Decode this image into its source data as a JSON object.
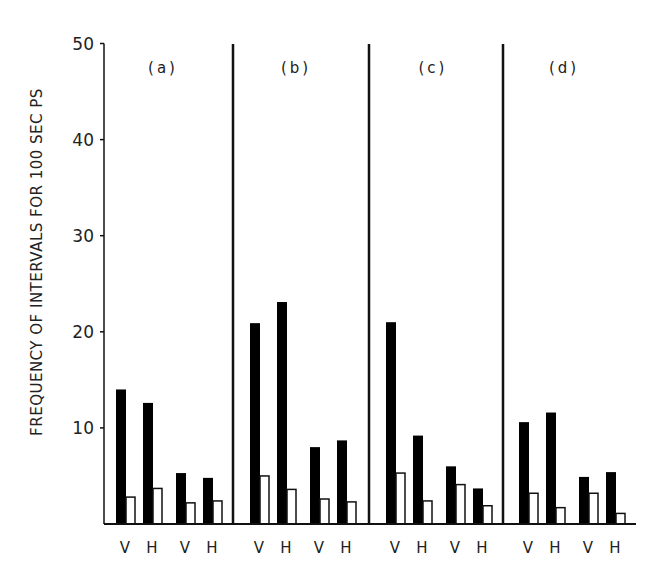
{
  "chart_data": {
    "type": "bar",
    "title": "",
    "xlabel": "",
    "ylabel": "FREQUENCY OF INTERVALS FOR 100 SEC PS",
    "ylim": [
      0,
      50
    ],
    "yticks": [
      10,
      20,
      30,
      40,
      50
    ],
    "ytick_labels": [
      "10",
      "20",
      "30",
      "40",
      "50"
    ],
    "grid": false,
    "legend": null,
    "panels": [
      {
        "label": "(a)",
        "categories": [
          "V",
          "H",
          "V",
          "H"
        ],
        "series": [
          {
            "name": "filled",
            "color": "#000000",
            "values": [
              14.0,
              12.6,
              5.3,
              4.8
            ]
          },
          {
            "name": "open",
            "color": "#ffffff",
            "values": [
              2.8,
              3.7,
              2.2,
              2.4
            ]
          }
        ]
      },
      {
        "label": "(b)",
        "categories": [
          "V",
          "H",
          "V",
          "H"
        ],
        "series": [
          {
            "name": "filled",
            "color": "#000000",
            "values": [
              20.9,
              23.1,
              8.0,
              8.7
            ]
          },
          {
            "name": "open",
            "color": "#ffffff",
            "values": [
              5.0,
              3.6,
              2.6,
              2.3
            ]
          }
        ]
      },
      {
        "label": "(c)",
        "categories": [
          "V",
          "H",
          "V",
          "H"
        ],
        "series": [
          {
            "name": "filled",
            "color": "#000000",
            "values": [
              21.0,
              9.2,
              6.0,
              3.7
            ]
          },
          {
            "name": "open",
            "color": "#ffffff",
            "values": [
              5.3,
              2.4,
              4.1,
              1.9
            ]
          }
        ]
      },
      {
        "label": "(d)",
        "categories": [
          "V",
          "H",
          "V",
          "H"
        ],
        "series": [
          {
            "name": "filled",
            "color": "#000000",
            "values": [
              10.6,
              11.6,
              4.9,
              5.4
            ]
          },
          {
            "name": "open",
            "color": "#ffffff",
            "values": [
              3.2,
              1.7,
              3.2,
              1.1
            ]
          }
        ]
      }
    ]
  }
}
